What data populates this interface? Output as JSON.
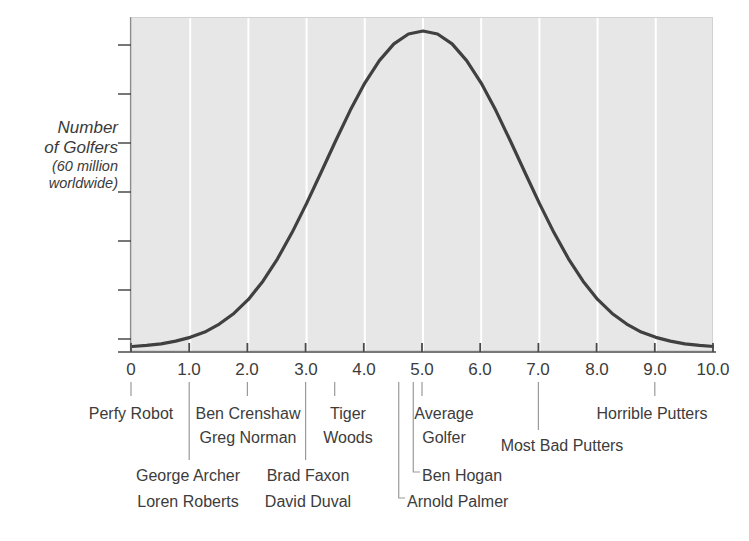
{
  "chart_data": {
    "type": "line",
    "title": "",
    "subtitle": "",
    "xlabel": "",
    "ylabel": "Number of Golfers (60 million worldwide)",
    "ylabel_lines": [
      "Number",
      "of Golfers",
      "(60 million",
      "worldwide)"
    ],
    "xlim": [
      0,
      10
    ],
    "ylim": [
      0,
      1
    ],
    "grid": true,
    "grid_axis": "x",
    "legend": "none",
    "distribution": {
      "shape": "normal bell curve",
      "mean": 5.0,
      "std_dev": 1.5,
      "peak_x": 5.0,
      "peak_marker": "dotted vertical line at 5.0"
    },
    "x": [
      0.0,
      0.25,
      0.5,
      0.75,
      1.0,
      1.25,
      1.5,
      1.75,
      2.0,
      2.25,
      2.5,
      2.75,
      3.0,
      3.25,
      3.5,
      3.75,
      4.0,
      4.25,
      4.5,
      4.75,
      5.0,
      5.25,
      5.5,
      5.75,
      6.0,
      6.25,
      6.5,
      6.75,
      7.0,
      7.25,
      7.5,
      7.75,
      8.0,
      8.25,
      8.5,
      8.75,
      9.0,
      9.25,
      9.5,
      9.75,
      10.0
    ],
    "y": [
      0.004,
      0.007,
      0.011,
      0.018,
      0.028,
      0.042,
      0.063,
      0.091,
      0.128,
      0.176,
      0.235,
      0.304,
      0.381,
      0.463,
      0.546,
      0.626,
      0.698,
      0.757,
      0.801,
      0.827,
      0.835,
      0.827,
      0.801,
      0.757,
      0.698,
      0.626,
      0.546,
      0.463,
      0.381,
      0.304,
      0.235,
      0.176,
      0.128,
      0.091,
      0.063,
      0.042,
      0.028,
      0.018,
      0.011,
      0.007,
      0.004
    ],
    "xticks": [
      "0",
      "1.0",
      "2.0",
      "3.0",
      "4.0",
      "5.0",
      "6.0",
      "7.0",
      "8.0",
      "9.0",
      "10.0"
    ],
    "xtick_values": [
      0,
      1,
      2,
      3,
      4,
      5,
      6,
      7,
      8,
      9,
      10
    ],
    "ytick_count": 7,
    "yticks": [],
    "gridlines_at": [
      1,
      2,
      3,
      4,
      5,
      6,
      7,
      8,
      9
    ],
    "annotations": [
      {
        "label": "Perfy Robot",
        "x": 0.0,
        "anchor": "center"
      },
      {
        "label": "Ben Crenshaw",
        "x": 2.0,
        "anchor": "center"
      },
      {
        "label": "Greg Norman",
        "x": 2.0,
        "anchor": "center"
      },
      {
        "label": "Tiger Woods",
        "x": 3.5,
        "anchor": "center"
      },
      {
        "label": "George Archer",
        "x": 1.0,
        "anchor": "center"
      },
      {
        "label": "Loren Roberts",
        "x": 1.0,
        "anchor": "center"
      },
      {
        "label": "Brad Faxon",
        "x": 3.0,
        "anchor": "center"
      },
      {
        "label": "David Duval",
        "x": 3.0,
        "anchor": "center"
      },
      {
        "label": "Average Golfer",
        "x": 5.0,
        "anchor": "center"
      },
      {
        "label": "Ben Hogan",
        "x": 4.85,
        "anchor": "left"
      },
      {
        "label": "Arnold Palmer",
        "x": 4.6,
        "anchor": "left"
      },
      {
        "label": "Most Bad Putters",
        "x": 7.0,
        "anchor": "center"
      },
      {
        "label": "Horrible Putters",
        "x": 9.0,
        "anchor": "center"
      }
    ],
    "colors": {
      "plot_background": "#e7e7e7",
      "curve": "#404040",
      "gridline": "#ffffff",
      "axis": "#4a4a4a",
      "text": "#3c3c3c",
      "peak_marker": "#ffffff"
    }
  },
  "labels": {
    "y_axis_line1": "Number",
    "y_axis_line2": "of Golfers",
    "y_axis_line3": "(60 million",
    "y_axis_line4": "worldwide)",
    "tick_0": "0",
    "tick_1": "1.0",
    "tick_2": "2.0",
    "tick_3": "3.0",
    "tick_4": "4.0",
    "tick_5": "5.0",
    "tick_6": "6.0",
    "tick_7": "7.0",
    "tick_8": "8.0",
    "tick_9": "9.0",
    "tick_10": "10.0",
    "perfy_robot": "Perfy Robot",
    "ben_crenshaw": "Ben Crenshaw",
    "greg_norman": "Greg Norman",
    "tiger": "Tiger",
    "woods": "Woods",
    "george_archer": "George Archer",
    "loren_roberts": "Loren Roberts",
    "brad_faxon": "Brad Faxon",
    "david_duval": "David Duval",
    "average": "Average",
    "golfer": "Golfer",
    "ben_hogan": "Ben Hogan",
    "arnold_palmer": "Arnold Palmer",
    "most_bad_putters": "Most Bad Putters",
    "horrible_putters": "Horrible Putters"
  }
}
